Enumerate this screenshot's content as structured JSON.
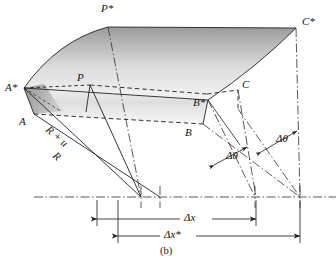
{
  "figure": {
    "caption": "(b)",
    "colors": {
      "line": "#232323",
      "shade_dark": "#8e8e8e",
      "shade_light": "#f2f2f2",
      "text": "#141414"
    },
    "labels": {
      "p_star": "P*",
      "c_star": "C*",
      "a_star": "A*",
      "b_star": "B*",
      "p": "P",
      "a": "A",
      "b": "B",
      "c": "C",
      "r_plus_u": "R + u",
      "r": "R",
      "delta_theta_1": "Δθ",
      "delta_theta_2": "Δθ",
      "delta_x": "Δx",
      "delta_x_star": "Δx*"
    },
    "label_positions": {
      "p_star": {
        "x": 101,
        "y": 3
      },
      "c_star": {
        "x": 302,
        "y": 16
      },
      "a_star": {
        "x": 7,
        "y": 82
      },
      "p": {
        "x": 77,
        "y": 72
      },
      "b_star": {
        "x": 194,
        "y": 97
      },
      "c": {
        "x": 243,
        "y": 79
      },
      "a": {
        "x": 20,
        "y": 116
      },
      "b": {
        "x": 186,
        "y": 127
      },
      "r_plus_u": {
        "x": 51,
        "y": 124
      },
      "r": {
        "x": 58,
        "y": 150
      },
      "delta_theta_1": {
        "x": 226,
        "y": 150
      },
      "delta_theta_2": {
        "x": 276,
        "y": 133
      },
      "delta_x": {
        "x": 186,
        "y": 211
      },
      "delta_x_star": {
        "x": 168,
        "y": 230
      },
      "caption": {
        "x": 160,
        "y": 246
      }
    },
    "dimensions": {
      "delta_x": {
        "from": 97,
        "to": 256,
        "y": 219
      },
      "delta_x_star": {
        "from": 118,
        "to": 300,
        "y": 236
      }
    }
  }
}
